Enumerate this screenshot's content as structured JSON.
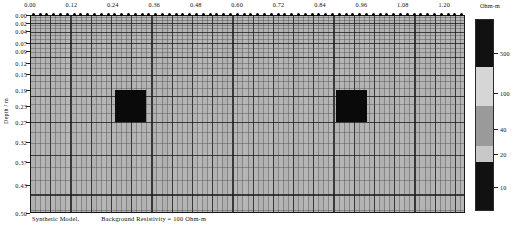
{
  "figure": {
    "caption_part1": "Synthetic Model,",
    "caption_part2": "Background Resistivity = 100 Ohm-m"
  },
  "axes": {
    "x": {
      "label": "",
      "ticks": [
        "0.00",
        "0.12",
        "0.24",
        "0.36",
        "0.48",
        "0.60",
        "0.72",
        "0.84",
        "0.96",
        "1.08",
        "1.20"
      ],
      "tick_values": [
        0.0,
        0.12,
        0.24,
        0.36,
        0.48,
        0.6,
        0.72,
        0.84,
        0.96,
        1.08,
        1.2
      ],
      "range": [
        0.0,
        1.26
      ],
      "position": "top"
    },
    "y": {
      "label": "Depth / m",
      "ticks": [
        "0.00",
        "0.02",
        "0.04",
        "0.07",
        "0.09",
        "0.12",
        "0.15",
        "0.19",
        "0.23",
        "0.27",
        "0.32",
        "0.37",
        "0.43",
        "0.50"
      ],
      "tick_values": [
        0.0,
        0.02,
        0.04,
        0.07,
        0.09,
        0.12,
        0.15,
        0.19,
        0.23,
        0.27,
        0.32,
        0.37,
        0.43,
        0.5
      ],
      "range": [
        0.0,
        0.5
      ],
      "direction": "down"
    }
  },
  "colorbar": {
    "title": "Ohm-m",
    "ticks": [
      "500",
      "100",
      "40",
      "20",
      "10"
    ],
    "tick_values": [
      500,
      100,
      40,
      20,
      10
    ],
    "segments": [
      {
        "value": "500",
        "color": "#111111"
      },
      {
        "value": "100",
        "color": "#d6d6d6"
      },
      {
        "value": "40",
        "color": "#9a9a9a"
      },
      {
        "value": "20",
        "color": "#c8c8c8"
      },
      {
        "value": "10",
        "color": "#111111"
      }
    ]
  },
  "chart_data": {
    "type": "heatmap",
    "xlabel": "",
    "ylabel": "Depth / m",
    "xlim": [
      0.0,
      1.26
    ],
    "ylim": [
      0.5,
      0.0
    ],
    "grid": true,
    "legend": "right colorbar, Ohm-m",
    "units": "Ohm-m",
    "background_resistivity": 100,
    "colorbar_ticks": [
      500,
      100,
      40,
      20,
      10
    ],
    "x_ticks": [
      0.0,
      0.12,
      0.24,
      0.36,
      0.48,
      0.6,
      0.72,
      0.84,
      0.96,
      1.08,
      1.2
    ],
    "y_ticks": [
      0.0,
      0.02,
      0.04,
      0.07,
      0.09,
      0.12,
      0.15,
      0.19,
      0.23,
      0.27,
      0.32,
      0.37,
      0.43,
      0.5
    ],
    "anomalies": [
      {
        "name": "left-conductive-block",
        "x_start": 0.245,
        "x_end": 0.335,
        "depth_start": 0.19,
        "depth_end": 0.27,
        "resistivity": 10,
        "color": "#0a0a0a"
      },
      {
        "name": "right-conductive-block",
        "x_start": 0.885,
        "x_end": 0.975,
        "depth_start": 0.19,
        "depth_end": 0.27,
        "resistivity": 10,
        "color": "#0a0a0a"
      }
    ],
    "electrode_count": 64,
    "electrode_depth": 0.0
  }
}
